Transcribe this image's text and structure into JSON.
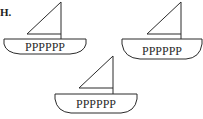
{
  "question_label": "H.",
  "boats": [
    {
      "id": "boat-top-left",
      "hull_text": "PPPPPP"
    },
    {
      "id": "boat-top-right",
      "hull_text": "PPPPPP"
    },
    {
      "id": "boat-bottom-center",
      "hull_text": "PPPPPP"
    }
  ],
  "colors": {
    "stroke": "#2a2a2a",
    "background": "#ffffff"
  }
}
